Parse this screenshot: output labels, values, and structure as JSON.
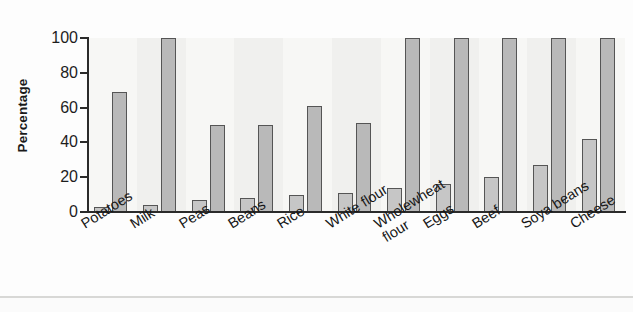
{
  "chart_data": {
    "type": "bar",
    "title": "",
    "xlabel": "",
    "ylabel": "Percentage",
    "ylim": [
      0,
      100
    ],
    "yticks": [
      0,
      20,
      40,
      60,
      80,
      100
    ],
    "ytick_labels": [
      "0",
      "20",
      "40",
      "60",
      "80",
      "100"
    ],
    "grid": true,
    "legend": "none",
    "categories": [
      "Potatoes",
      "Milk",
      "Peas",
      "Beans",
      "Rice",
      "White flour",
      "Wholewheat flour",
      "Eggs",
      "Beef",
      "Soya beans",
      "Cheese"
    ],
    "series": [
      {
        "name": "Lower bar",
        "values": [
          3,
          4,
          7,
          8,
          10,
          11,
          14,
          16,
          20,
          27,
          42
        ]
      },
      {
        "name": "Upper bar",
        "values": [
          69,
          100,
          50,
          50,
          61,
          51,
          101,
          101,
          101,
          101,
          101
        ]
      }
    ],
    "bar_color": "#b9b9b9",
    "bar_border_color": "#555555",
    "plot_background": "#f2f2f0",
    "axis_color": "#2b2b2b",
    "gridline_color": "#dedcd8"
  }
}
